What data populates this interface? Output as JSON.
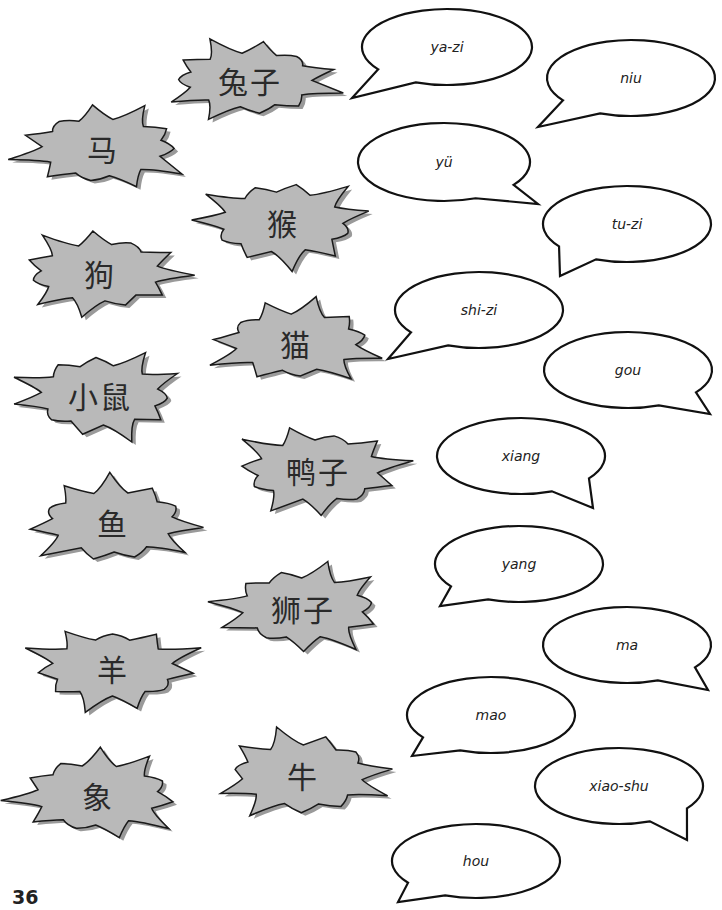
{
  "page": {
    "number": "36"
  },
  "colors": {
    "burst_fill": "#b9b9b9",
    "burst_stroke": "#1a1a1a",
    "bubble_stroke": "#111111"
  },
  "characters": [
    {
      "text": "兔子",
      "x": 150,
      "y": 35,
      "w": 200,
      "h": 90
    },
    {
      "text": "马",
      "x": 5,
      "y": 100,
      "w": 195,
      "h": 95
    },
    {
      "text": "猴",
      "x": 185,
      "y": 172,
      "w": 195,
      "h": 100
    },
    {
      "text": "狗",
      "x": 5,
      "y": 225,
      "w": 190,
      "h": 95
    },
    {
      "text": "猫",
      "x": 198,
      "y": 295,
      "w": 195,
      "h": 95
    },
    {
      "text": "小鼠",
      "x": 5,
      "y": 345,
      "w": 190,
      "h": 100
    },
    {
      "text": "鸭子",
      "x": 220,
      "y": 420,
      "w": 195,
      "h": 100
    },
    {
      "text": "鱼",
      "x": 15,
      "y": 472,
      "w": 195,
      "h": 100
    },
    {
      "text": "狮子",
      "x": 205,
      "y": 558,
      "w": 195,
      "h": 100
    },
    {
      "text": "羊",
      "x": 15,
      "y": 620,
      "w": 195,
      "h": 95
    },
    {
      "text": "牛",
      "x": 205,
      "y": 725,
      "w": 195,
      "h": 100
    },
    {
      "text": "象",
      "x": 0,
      "y": 745,
      "w": 195,
      "h": 100
    }
  ],
  "pinyin": [
    {
      "text": "ya-zi",
      "cx": 447,
      "cy": 47,
      "rx": 85,
      "ry": 38,
      "tail": "bl",
      "tx": 352,
      "ty": 98
    },
    {
      "text": "niu",
      "cx": 631,
      "cy": 78,
      "rx": 84,
      "ry": 38,
      "tail": "bl",
      "tx": 538,
      "ty": 127
    },
    {
      "text": "yü",
      "cx": 444,
      "cy": 162,
      "rx": 86,
      "ry": 39,
      "tail": "br",
      "tx": 538,
      "ty": 204
    },
    {
      "text": "tu-zi",
      "cx": 627,
      "cy": 224,
      "rx": 84,
      "ry": 38,
      "tail": "bl",
      "tx": 560,
      "ty": 276
    },
    {
      "text": "shi-zi",
      "cx": 479,
      "cy": 310,
      "rx": 84,
      "ry": 38,
      "tail": "bl",
      "tx": 388,
      "ty": 359
    },
    {
      "text": "gou",
      "cx": 628,
      "cy": 370,
      "rx": 84,
      "ry": 38,
      "tail": "br",
      "tx": 710,
      "ty": 414
    },
    {
      "text": "xiang",
      "cx": 521,
      "cy": 456,
      "rx": 84,
      "ry": 38,
      "tail": "br",
      "tx": 593,
      "ty": 508
    },
    {
      "text": "yang",
      "cx": 519,
      "cy": 564,
      "rx": 84,
      "ry": 38,
      "tail": "bl",
      "tx": 440,
      "ty": 606
    },
    {
      "text": "ma",
      "cx": 627,
      "cy": 645,
      "rx": 84,
      "ry": 38,
      "tail": "br",
      "tx": 708,
      "ty": 690
    },
    {
      "text": "mao",
      "cx": 491,
      "cy": 715,
      "rx": 84,
      "ry": 38,
      "tail": "bl",
      "tx": 412,
      "ty": 756
    },
    {
      "text": "xiao-shu",
      "cx": 619,
      "cy": 786,
      "rx": 84,
      "ry": 38,
      "tail": "br",
      "tx": 687,
      "ty": 840
    },
    {
      "text": "hou",
      "cx": 476,
      "cy": 861,
      "rx": 84,
      "ry": 37,
      "tail": "bl",
      "tx": 398,
      "ty": 902
    }
  ]
}
